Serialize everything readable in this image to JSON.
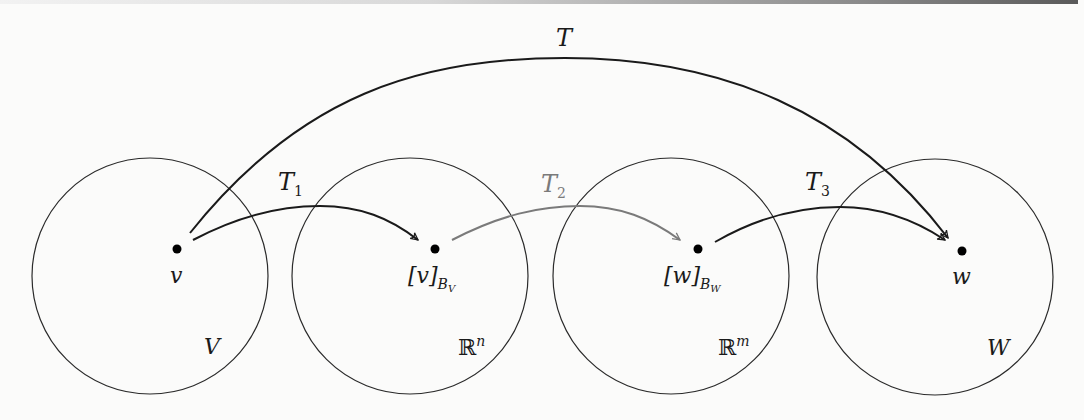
{
  "diagram": {
    "colors": {
      "ink": "#1a1a1a",
      "t2_arrow": "#7a7a7a",
      "background": "#fbfbfa"
    },
    "spaces": [
      {
        "id": "V",
        "label": "V",
        "point_label": "v",
        "point_sub": ""
      },
      {
        "id": "Rn",
        "label": "ℝ",
        "label_sup": "n",
        "point_label": "[v]",
        "point_sub": "B",
        "point_subsub": "V"
      },
      {
        "id": "Rm",
        "label": "ℝ",
        "label_sup": "m",
        "point_label": "[w]",
        "point_sub": "B",
        "point_subsub": "W"
      },
      {
        "id": "W",
        "label": "W",
        "point_label": "w",
        "point_sub": ""
      }
    ],
    "arrows": [
      {
        "id": "T",
        "label": "T",
        "sub": "",
        "from": "v",
        "to": "w"
      },
      {
        "id": "T1",
        "label": "T",
        "sub": "1",
        "from": "v",
        "to": "[v]_BV"
      },
      {
        "id": "T2",
        "label": "T",
        "sub": "2",
        "from": "[v]_BV",
        "to": "[w]_BW"
      },
      {
        "id": "T3",
        "label": "T",
        "sub": "3",
        "from": "[w]_BW",
        "to": "w"
      }
    ]
  }
}
